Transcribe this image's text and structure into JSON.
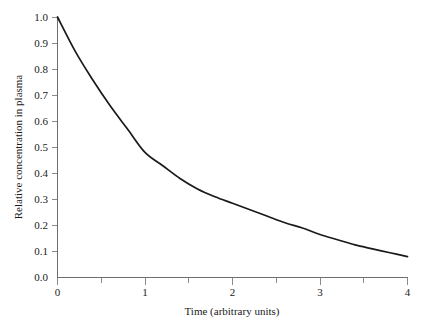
{
  "figure": {
    "background_color": "#ffffff",
    "axis_color": "#6e6e6e",
    "curve_color": "#1a1a1a"
  },
  "chart_data": {
    "type": "line",
    "title": "",
    "subtitle": "",
    "xlabel": "Time (arbitrary units)",
    "ylabel": "Relative concentration in plasma",
    "xlim": [
      0,
      4
    ],
    "ylim": [
      0.0,
      1.0
    ],
    "grid": false,
    "legend": null,
    "legend_position": "none",
    "xticks": [
      0,
      1,
      2,
      3,
      4
    ],
    "xticklabels": [
      "0",
      "1",
      "2",
      "3",
      "4"
    ],
    "xminorticks": [
      0.5,
      1.5,
      2.5,
      3.5
    ],
    "yticks": [
      0.0,
      0.1,
      0.2,
      0.3,
      0.4,
      0.5,
      0.6,
      0.7,
      0.8,
      0.9,
      1.0
    ],
    "yticklabels": [
      "0.0",
      "0.1",
      "0.2",
      "0.3",
      "0.4",
      "0.5",
      "0.6",
      "0.7",
      "0.8",
      "0.9",
      "1.0"
    ],
    "annotations": [],
    "series": [
      {
        "name": "Relative concentration in plasma",
        "x": [
          0.0,
          0.2,
          0.4,
          0.6,
          0.8,
          1.0,
          1.2,
          1.4,
          1.6,
          1.8,
          2.0,
          2.2,
          2.4,
          2.6,
          2.8,
          3.0,
          3.2,
          3.4,
          3.6,
          3.8,
          4.0
        ],
        "values": [
          1.0,
          0.87,
          0.76,
          0.66,
          0.57,
          0.48,
          0.43,
          0.38,
          0.34,
          0.31,
          0.285,
          0.26,
          0.235,
          0.21,
          0.19,
          0.165,
          0.145,
          0.125,
          0.11,
          0.095,
          0.08
        ]
      }
    ]
  }
}
